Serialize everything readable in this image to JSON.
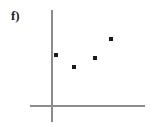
{
  "figure": {
    "panel_label": "f)",
    "label_color": "#231f20",
    "background_color": "#ffffff"
  },
  "axes": {
    "axis_color": "#8c8c8c",
    "origin_x_px": 51,
    "origin_y_px": 105,
    "y_axis": {
      "name": "y-axis",
      "top_px": 10,
      "bottom_px": 122
    },
    "x_axis": {
      "name": "x-axis",
      "left_px": 30,
      "right_px": 145
    }
  },
  "marker": {
    "shape": "square",
    "color": "#1a1a1a",
    "size_px": 4
  },
  "chart_data": {
    "type": "scatter",
    "title": "f)",
    "xlabel": "",
    "ylabel": "",
    "grid": false,
    "legend": false,
    "xlim": [
      0,
      94
    ],
    "ylim": [
      0,
      95
    ],
    "x": [
      5,
      23,
      44,
      60
    ],
    "y": [
      50,
      38,
      47,
      66
    ],
    "points": [
      {
        "x": 5,
        "y": 50,
        "px": 56,
        "py": 55
      },
      {
        "x": 23,
        "y": 38,
        "px": 74,
        "py": 67
      },
      {
        "x": 44,
        "y": 47,
        "px": 95,
        "py": 58
      },
      {
        "x": 60,
        "y": 66,
        "px": 111,
        "py": 39
      }
    ],
    "series": [
      {
        "name": "series-1",
        "values": [
          50,
          38,
          47,
          66
        ]
      }
    ]
  }
}
